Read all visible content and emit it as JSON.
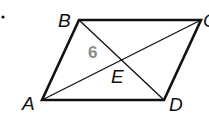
{
  "figure": {
    "marker": "•",
    "vertices": {
      "A": {
        "label": "A",
        "x": 42,
        "y": 100
      },
      "B": {
        "label": "B",
        "x": 79,
        "y": 20
      },
      "C": {
        "label": "C",
        "x": 201,
        "y": 20
      },
      "D": {
        "label": "D",
        "x": 164,
        "y": 100
      }
    },
    "intersection": {
      "label": "E",
      "x": 121,
      "y": 62
    },
    "segment_label": {
      "text": "6",
      "segment": "BE",
      "color": "#8a8a8a"
    },
    "line_color": "#111111"
  }
}
